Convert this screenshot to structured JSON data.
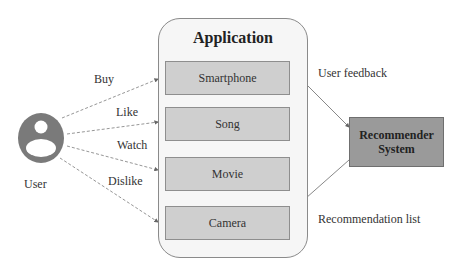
{
  "user": {
    "label": "User",
    "icon": "user-icon"
  },
  "actions": [
    {
      "label": "Buy"
    },
    {
      "label": "Like"
    },
    {
      "label": "Watch"
    },
    {
      "label": "Dislike"
    }
  ],
  "application": {
    "title": "Application",
    "items": [
      {
        "label": "Smartphone"
      },
      {
        "label": "Song"
      },
      {
        "label": "Movie"
      },
      {
        "label": "Camera"
      }
    ]
  },
  "recommender": {
    "line1": "Recommender",
    "line2": "System"
  },
  "flows": {
    "feedback": "User feedback",
    "recommendations": "Recommendation list"
  },
  "colors": {
    "item_fill": "#cfcfcf",
    "recommender_fill": "#9a9a9a",
    "user_icon": "#7a7a7a"
  }
}
